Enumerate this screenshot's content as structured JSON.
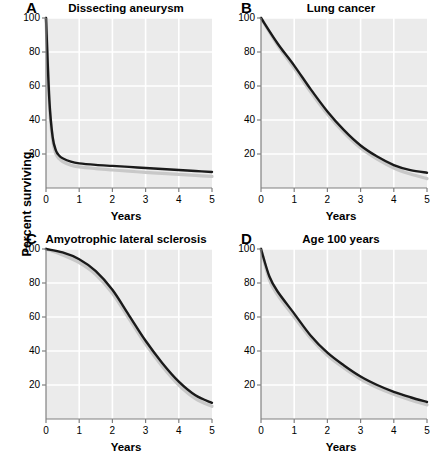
{
  "figure": {
    "shared_ylabel": "Percent surviving",
    "xlabel": "Years",
    "panel_letters": [
      "A",
      "B",
      "C",
      "D"
    ],
    "background_color": "#ffffff",
    "plot_background_color": "#ebebeb",
    "gridline_color": "#ffffff",
    "curve_color": "#1a1a1a",
    "confidence_band_color": "#c8c8c8",
    "axis_color": "#808080"
  },
  "axes": {
    "y_ticks": [
      20,
      40,
      60,
      80,
      100
    ],
    "y_tick_labels": [
      "20",
      "40",
      "60",
      "80",
      "100"
    ],
    "x_ticks": [
      0,
      1,
      2,
      3,
      4,
      5
    ],
    "x_tick_labels": [
      "0",
      "1",
      "2",
      "3",
      "4",
      "5"
    ],
    "ylim": [
      0,
      100
    ],
    "xlim": [
      0,
      5
    ]
  },
  "chart_data": [
    {
      "type": "line",
      "panel": "A",
      "title": "Dissecting aneurysm",
      "xlabel": "Years",
      "ylabel": "Percent surviving",
      "xlim": [
        0,
        5
      ],
      "ylim": [
        0,
        100
      ],
      "grid": true,
      "legend": "none",
      "x": [
        0,
        0.1,
        0.2,
        0.3,
        0.4,
        0.5,
        0.75,
        1,
        1.5,
        2,
        2.5,
        3,
        3.5,
        4,
        4.5,
        5
      ],
      "series": [
        {
          "name": "Survival estimate",
          "values": [
            100,
            52,
            30,
            22,
            19,
            17.5,
            15.5,
            14.5,
            13.6,
            13,
            12.4,
            11.8,
            11.2,
            10.6,
            10.0,
            9.4
          ]
        },
        {
          "name": "Confidence band lower",
          "values": [
            100,
            50,
            28,
            20,
            17.2,
            15.6,
            13.4,
            12.4,
            11.4,
            10.6,
            9.9,
            9.2,
            8.6,
            8.0,
            7.4,
            6.8
          ]
        }
      ]
    },
    {
      "type": "line",
      "panel": "B",
      "title": "Lung cancer",
      "xlabel": "Years",
      "ylabel": "Percent surviving",
      "xlim": [
        0,
        5
      ],
      "ylim": [
        0,
        100
      ],
      "grid": true,
      "legend": "none",
      "x": [
        0,
        0.5,
        1,
        1.5,
        2,
        2.5,
        3,
        3.5,
        4,
        4.5,
        5
      ],
      "series": [
        {
          "name": "Survival estimate",
          "values": [
            100,
            85,
            72,
            58,
            45,
            34,
            25,
            18.5,
            13.5,
            10.5,
            9.0
          ]
        },
        {
          "name": "Confidence band lower",
          "values": [
            100,
            84,
            70.5,
            56.5,
            43.5,
            32.5,
            23.5,
            17.0,
            11.8,
            8.2,
            5.5
          ]
        }
      ]
    },
    {
      "type": "line",
      "panel": "C",
      "title": "Amyotrophic lateral sclerosis",
      "xlabel": "Years",
      "ylabel": "Percent surviving",
      "xlim": [
        0,
        5
      ],
      "ylim": [
        0,
        100
      ],
      "grid": true,
      "legend": "none",
      "x": [
        0,
        0.5,
        1,
        1.5,
        2,
        2.5,
        3,
        3.5,
        4,
        4.5,
        5
      ],
      "series": [
        {
          "name": "Survival estimate",
          "values": [
            100,
            98,
            94,
            87,
            76,
            61,
            46,
            33,
            22,
            14,
            9.5
          ]
        },
        {
          "name": "Confidence band lower",
          "values": [
            100,
            96.5,
            92,
            85,
            74,
            59,
            44,
            31,
            20,
            12,
            7.5
          ]
        }
      ]
    },
    {
      "type": "line",
      "panel": "D",
      "title": "Age 100 years",
      "xlabel": "Years",
      "ylabel": "Percent surviving",
      "xlim": [
        0,
        5
      ],
      "ylim": [
        0,
        100
      ],
      "grid": true,
      "legend": "none",
      "x": [
        0,
        0.25,
        0.5,
        1,
        1.5,
        2,
        2.5,
        3,
        3.5,
        4,
        4.5,
        5
      ],
      "series": [
        {
          "name": "Survival estimate",
          "values": [
            100,
            84,
            75,
            62,
            49,
            39,
            31.5,
            25,
            20,
            16,
            12.8,
            10.0
          ]
        },
        {
          "name": "Confidence band lower",
          "values": [
            100,
            82,
            73,
            60,
            47.5,
            37.5,
            30,
            23.5,
            18.5,
            14.5,
            11.2,
            8.3
          ]
        }
      ]
    }
  ]
}
